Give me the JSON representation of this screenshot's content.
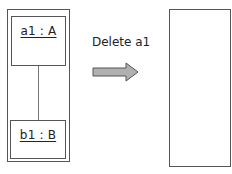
{
  "diagram": {
    "before": {
      "objects": [
        {
          "id": "a1",
          "label": "a1 : A"
        },
        {
          "id": "b1",
          "label": "b1 : B"
        }
      ],
      "link": {
        "from": "a1",
        "to": "b1"
      }
    },
    "action": {
      "label": "Delete a1",
      "arrow": "right-arrow"
    },
    "after": {
      "objects": []
    }
  },
  "colors": {
    "stroke": "#555555",
    "arrow_fill": "#b0b0b0",
    "arrow_stroke": "#555555",
    "text": "#222222"
  }
}
